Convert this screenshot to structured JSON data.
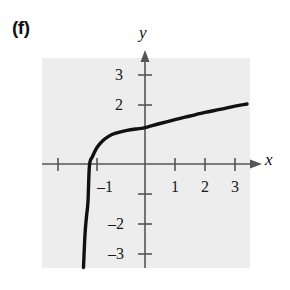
{
  "figure": {
    "part_label": "(f)",
    "axis_labels": {
      "x": "x",
      "y": "y"
    },
    "colors": {
      "plot_background": "#ededed",
      "axis": "#555555",
      "curve": "#111111",
      "text": "#111111"
    }
  },
  "chart_data": {
    "type": "line",
    "title": "",
    "xlabel": "x",
    "ylabel": "y",
    "grid": false,
    "legend": false,
    "xlim": [
      -2.55,
      3.55
    ],
    "ylim": [
      -3.6,
      3.7
    ],
    "xticks": [
      -2,
      -1,
      1,
      2,
      3
    ],
    "yticks": [
      3,
      2,
      -1,
      -2,
      -3
    ],
    "xtick_labels": [
      "",
      "–1",
      "1",
      "2",
      "3"
    ],
    "ytick_labels": [
      "3",
      "2",
      "–1",
      "–2",
      "–3"
    ],
    "x_tick_labels_shown": [
      "–1",
      "1",
      "2",
      "3"
    ],
    "y_tick_labels_shown": [
      "3",
      "2",
      "–2",
      "–3"
    ],
    "asymptote_x": -2.1,
    "x_intercept": -1.85,
    "series": [
      {
        "name": "curve",
        "x": [
          -2.05,
          -2.0,
          -1.95,
          -1.9,
          -1.85,
          -1.75,
          -1.6,
          -1.4,
          -1.2,
          -1.0,
          -0.6,
          -0.2,
          0.0,
          0.5,
          1.0,
          1.5,
          2.0,
          2.5,
          3.0,
          3.4
        ],
        "y": [
          -3.45,
          -2.35,
          -1.75,
          -1.25,
          -0.03,
          0.25,
          0.55,
          0.78,
          0.93,
          1.02,
          1.12,
          1.18,
          1.21,
          1.35,
          1.48,
          1.6,
          1.72,
          1.82,
          1.93,
          2.0
        ]
      }
    ]
  },
  "tick_labels": {
    "y_pos_3": "3",
    "y_pos_2": "2",
    "y_neg_2": "–2",
    "y_neg_3": "–3",
    "x_neg_1": "–1",
    "x_pos_1": "1",
    "x_pos_2": "2",
    "x_pos_3": "3"
  }
}
